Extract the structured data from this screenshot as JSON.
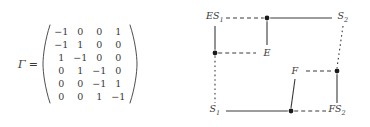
{
  "matrix_figure": {
    "symbol": "Γ",
    "equals": "=",
    "rows": [
      [
        "−1",
        "0",
        "0",
        "1"
      ],
      [
        "−1",
        "1",
        "0",
        "0"
      ],
      [
        "1",
        "−1",
        "0",
        "0"
      ],
      [
        "0",
        "1",
        "−1",
        "0"
      ],
      [
        "0",
        "0",
        "−1",
        "1"
      ],
      [
        "0",
        "0",
        "1",
        "−1"
      ]
    ]
  },
  "graph_figure": {
    "nodes": [
      {
        "id": "ES1",
        "kind": "label",
        "label": "ES",
        "sub": "1",
        "x": 30,
        "y": 18
      },
      {
        "id": "n_top_mid",
        "kind": "dot",
        "label": "",
        "sub": "",
        "x": 82,
        "y": 18
      },
      {
        "id": "S2",
        "kind": "label",
        "label": "S",
        "sub": "2",
        "x": 158,
        "y": 18
      },
      {
        "id": "n_left_mid",
        "kind": "dot",
        "label": "",
        "sub": "",
        "x": 30,
        "y": 53
      },
      {
        "id": "E",
        "kind": "label",
        "label": "E",
        "sub": "",
        "x": 82,
        "y": 53
      },
      {
        "id": "F",
        "kind": "label",
        "label": "F",
        "sub": "",
        "x": 110,
        "y": 71
      },
      {
        "id": "n_right_mid",
        "kind": "dot",
        "label": "",
        "sub": "",
        "x": 152,
        "y": 71
      },
      {
        "id": "S1",
        "kind": "label",
        "label": "S",
        "sub": "1",
        "x": 30,
        "y": 111
      },
      {
        "id": "n_bot_mid",
        "kind": "dot",
        "label": "",
        "sub": "",
        "x": 106,
        "y": 111
      },
      {
        "id": "FS2",
        "kind": "label",
        "label": "FS",
        "sub": "2",
        "x": 152,
        "y": 111
      }
    ],
    "edges": [
      {
        "from": "ES1",
        "to": "n_top_mid",
        "style": "dashed",
        "orient": "h"
      },
      {
        "from": "n_top_mid",
        "to": "S2",
        "style": "solid",
        "orient": "h"
      },
      {
        "from": "ES1",
        "to": "n_left_mid",
        "style": "solid",
        "orient": "v"
      },
      {
        "from": "n_top_mid",
        "to": "E",
        "style": "solid",
        "orient": "v"
      },
      {
        "from": "n_left_mid",
        "to": "E",
        "style": "dashed",
        "orient": "h"
      },
      {
        "from": "S2",
        "to": "n_right_mid",
        "style": "dotted",
        "orient": "v"
      },
      {
        "from": "n_left_mid",
        "to": "S1",
        "style": "dotted",
        "orient": "v"
      },
      {
        "from": "F",
        "to": "n_right_mid",
        "style": "dashed",
        "orient": "h"
      },
      {
        "from": "F",
        "to": "n_bot_mid",
        "style": "solid",
        "orient": "v"
      },
      {
        "from": "n_right_mid",
        "to": "FS2",
        "style": "solid",
        "orient": "v"
      },
      {
        "from": "S1",
        "to": "n_bot_mid",
        "style": "solid",
        "orient": "h"
      },
      {
        "from": "n_bot_mid",
        "to": "FS2",
        "style": "dashed",
        "orient": "h"
      }
    ],
    "colors": {
      "stroke": "#3a3a3a",
      "node_fill": "#1a1a1a",
      "background": "#ffffff"
    }
  }
}
